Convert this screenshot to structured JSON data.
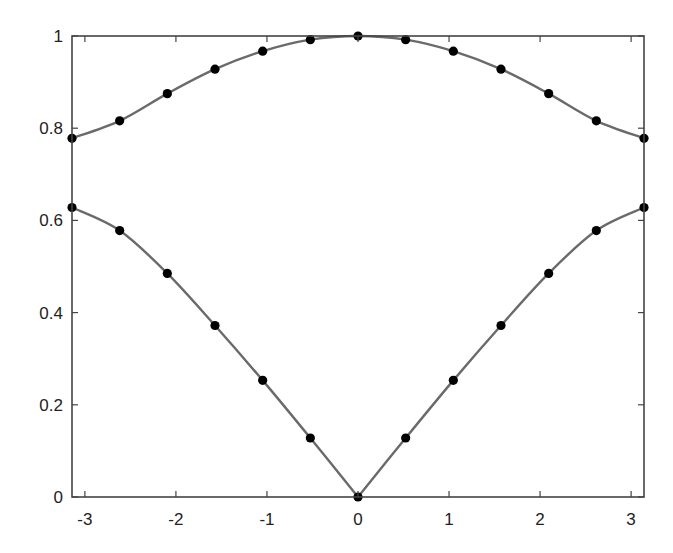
{
  "chart_data": {
    "type": "line",
    "title": "",
    "xlabel": "",
    "ylabel": "",
    "xlim": [
      -3.1416,
      3.1416
    ],
    "ylim": [
      0,
      1
    ],
    "grid": false,
    "legend": null,
    "x": [
      -3.1416,
      -2.618,
      -2.0944,
      -1.5708,
      -1.0472,
      -0.5236,
      0,
      0.5236,
      1.0472,
      1.5708,
      2.0944,
      2.618,
      3.1416
    ],
    "series": [
      {
        "name": "upper branch",
        "values": [
          0.778,
          0.816,
          0.875,
          0.928,
          0.967,
          0.992,
          1.0,
          0.992,
          0.967,
          0.928,
          0.875,
          0.816,
          0.778
        ],
        "line_color": "#6a6a6a",
        "marker": "filled-circle",
        "marker_color": "#000000"
      },
      {
        "name": "lower branch",
        "values": [
          0.628,
          0.578,
          0.485,
          0.372,
          0.253,
          0.128,
          0.0,
          0.128,
          0.253,
          0.372,
          0.485,
          0.578,
          0.628
        ],
        "line_color": "#6a6a6a",
        "marker": "filled-circle",
        "marker_color": "#000000"
      }
    ],
    "xticks": [
      -3,
      -2,
      -1,
      0,
      1,
      2,
      3
    ],
    "xtick_labels": [
      "-3",
      "-2",
      "-1",
      "0",
      "1",
      "2",
      "3"
    ],
    "yticks": [
      0,
      0.2,
      0.4,
      0.6,
      0.8,
      1
    ],
    "ytick_labels": [
      "0",
      "0.2",
      "0.4",
      "0.6",
      "0.8",
      "1"
    ]
  },
  "colors": {
    "axis": "#444444",
    "line": "#6a6a6a",
    "marker": "#000000",
    "background": "#ffffff"
  }
}
